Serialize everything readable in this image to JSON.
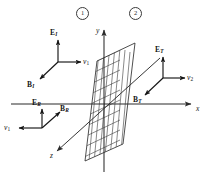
{
  "figure": {
    "ink_color": "#151515",
    "axis_color": "#2b2b2b",
    "hatch_color": "#3a3a3a",
    "background": "#ffffff",
    "width": 211,
    "height": 177
  },
  "regions": [
    {
      "id": "region-1",
      "label": "1"
    },
    {
      "id": "region-2",
      "label": "2"
    }
  ],
  "axes": [
    {
      "id": "x-axis",
      "label": "x"
    },
    {
      "id": "y-axis",
      "label": "y"
    },
    {
      "id": "z-axis",
      "label": "z"
    }
  ],
  "waves": {
    "incident": {
      "name": "incident",
      "e_label": "E",
      "e_sub": "I",
      "b_label": "B",
      "b_sub": "I",
      "v_label": "v",
      "v_sub": "1"
    },
    "reflected": {
      "name": "reflected",
      "e_label": "E",
      "e_sub": "R",
      "b_label": "B",
      "b_sub": "R",
      "v_label": "v",
      "v_sub": "1"
    },
    "transmitted": {
      "name": "transmitted",
      "e_label": "E",
      "e_sub": "T",
      "b_label": "B",
      "b_sub": "T",
      "v_label": "v",
      "v_sub": "2"
    }
  },
  "boundary_plane": {
    "name": "boundary-plane",
    "description": "hatched yz-plane at x = 0"
  }
}
